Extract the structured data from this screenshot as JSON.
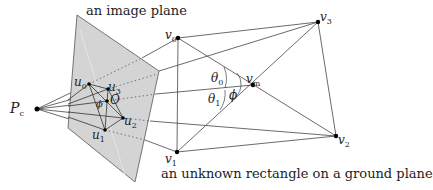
{
  "labels": {
    "image_plane": "an image plane",
    "ground_rect": "an unknown rectangle on a ground plane"
  },
  "points": {
    "Pc": {
      "base": "P",
      "sub": "c"
    },
    "u0": {
      "base": "u",
      "sub": "0"
    },
    "u1": {
      "base": "u",
      "sub": "1"
    },
    "u2": {
      "base": "u",
      "sub": "2"
    },
    "u3": {
      "base": "u",
      "sub": "3"
    },
    "O": {
      "base": "O",
      "sub": ""
    },
    "v0": {
      "base": "v",
      "sub": "0"
    },
    "v1": {
      "base": "v",
      "sub": "1"
    },
    "v2": {
      "base": "v",
      "sub": "2"
    },
    "v3": {
      "base": "v",
      "sub": "3"
    },
    "vm": {
      "base": "v",
      "sub": "m"
    }
  },
  "angles": {
    "theta0": {
      "base": "θ",
      "sub": "0"
    },
    "theta1": {
      "base": "θ",
      "sub": "1"
    },
    "phi": {
      "base": "ϕ",
      "sub": ""
    },
    "phi_image": {
      "base": "ϕ",
      "sub": ""
    }
  },
  "colors": {
    "plane_fill": "#d4d4d4",
    "line": "#444444",
    "point": "#000000"
  }
}
